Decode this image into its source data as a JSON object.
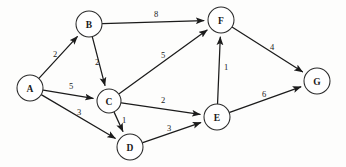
{
  "diagram": {
    "type": "directed-weighted-graph",
    "canvas": {
      "width": 346,
      "height": 167
    },
    "background_color": "#fdfdfc",
    "stroke_color": "#1b1b1b",
    "node_fill": "#ffffff",
    "node_radius": 13
  },
  "nodes": [
    {
      "id": "A",
      "label": "A",
      "x": 30,
      "y": 88,
      "r": 13
    },
    {
      "id": "B",
      "label": "B",
      "x": 89,
      "y": 24,
      "r": 13
    },
    {
      "id": "C",
      "label": "C",
      "x": 109,
      "y": 101,
      "r": 12
    },
    {
      "id": "D",
      "label": "D",
      "x": 130,
      "y": 147,
      "r": 13
    },
    {
      "id": "E",
      "label": "E",
      "x": 217,
      "y": 117,
      "r": 13
    },
    {
      "id": "F",
      "label": "F",
      "x": 221,
      "y": 20,
      "r": 13
    },
    {
      "id": "G",
      "label": "G",
      "x": 317,
      "y": 81,
      "r": 13
    }
  ],
  "edges": [
    {
      "id": "A-B",
      "from": "A",
      "to": "B",
      "weight": "2",
      "label_x": 55,
      "label_y": 54
    },
    {
      "id": "A-C",
      "from": "A",
      "to": "C",
      "weight": "5",
      "label_x": 71,
      "label_y": 86
    },
    {
      "id": "A-D",
      "from": "A",
      "to": "D",
      "weight": "3",
      "label_x": 79,
      "label_y": 112
    },
    {
      "id": "B-F",
      "from": "B",
      "to": "F",
      "weight": "8",
      "label_x": 156,
      "label_y": 14
    },
    {
      "id": "B-C",
      "from": "B",
      "to": "C",
      "weight": "2",
      "label_x": 97,
      "label_y": 62
    },
    {
      "id": "C-F",
      "from": "C",
      "to": "F",
      "weight": "5",
      "label_x": 163,
      "label_y": 55
    },
    {
      "id": "C-E",
      "from": "C",
      "to": "E",
      "weight": "2",
      "label_x": 163,
      "label_y": 100
    },
    {
      "id": "C-D",
      "from": "C",
      "to": "D",
      "weight": "1",
      "label_x": 124,
      "label_y": 120
    },
    {
      "id": "D-E",
      "from": "D",
      "to": "E",
      "weight": "3",
      "label_x": 169,
      "label_y": 128
    },
    {
      "id": "E-F",
      "from": "E",
      "to": "F",
      "weight": "1",
      "label_x": 226,
      "label_y": 67
    },
    {
      "id": "E-G",
      "from": "E",
      "to": "G",
      "weight": "6",
      "label_x": 264,
      "label_y": 94
    },
    {
      "id": "F-G",
      "from": "F",
      "to": "G",
      "weight": "4",
      "label_x": 272,
      "label_y": 47
    }
  ]
}
